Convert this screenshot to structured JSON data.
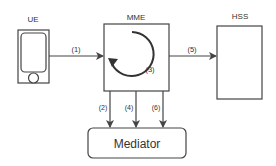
{
  "diagram": {
    "nodes": {
      "ue": {
        "label": "UE"
      },
      "mme": {
        "label": "MME"
      },
      "hss": {
        "label": "HSS"
      },
      "mediator": {
        "label": "Mediator"
      }
    },
    "edges": {
      "e1": {
        "label": "(1)",
        "from": "UE",
        "to": "MME"
      },
      "e2": {
        "label": "(2)",
        "from": "MME",
        "to": "Mediator"
      },
      "e3": {
        "label": "(3)",
        "from": "MME",
        "to": "MME"
      },
      "e4": {
        "label": "(4)",
        "from": "MME",
        "to": "Mediator"
      },
      "e5": {
        "label": "(5)",
        "from": "MME",
        "to": "HSS"
      },
      "e6": {
        "label": "(6)",
        "from": "MME",
        "to": "Mediator"
      }
    },
    "colors": {
      "stroke": "#444444",
      "text": "#333333",
      "background": "#ffffff"
    }
  }
}
